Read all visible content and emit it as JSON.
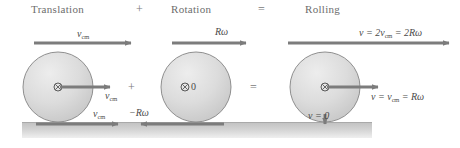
{
  "figure": {
    "title_row": {
      "translation": "Translation",
      "plus_top": "+",
      "rotation": "Rotation",
      "equals_top": "=",
      "rolling": "Rolling"
    },
    "operators": {
      "plus_mid": "+",
      "equals_mid": "="
    },
    "panels": [
      {
        "name": "translation",
        "heading": "Translation",
        "circle": {
          "cx": 58,
          "cy": 87,
          "r": 35
        },
        "center_marker": "⊗",
        "center_marker_value": "",
        "labels": {
          "top": "v_cm",
          "top_html": "v<sub>cm</sub>",
          "middle": "v_cm",
          "middle_html": "v<sub>cm</sub>",
          "bottom": "v_cm",
          "bottom_html": "v<sub>cm</sub>"
        }
      },
      {
        "name": "rotation",
        "heading": "Rotation",
        "circle": {
          "cx": 196,
          "cy": 87,
          "r": 35
        },
        "center_marker": "⊗",
        "center_marker_value": "0",
        "labels": {
          "top": "Rω",
          "top_html": "Rω",
          "bottom": "−Rω",
          "bottom_html": "−Rω"
        }
      },
      {
        "name": "rolling",
        "heading": "Rolling",
        "circle": {
          "cx": 325,
          "cy": 87,
          "r": 35
        },
        "center_marker": "⊗",
        "center_marker_value": "",
        "labels": {
          "top": "v = 2v_cm = 2Rω",
          "top_html": "v = 2v<sub>cm</sub> = 2Rω",
          "middle": "v = v_cm = Rω",
          "middle_html": "v = v<sub>cm</sub> = Rω",
          "bottom": "v = 0",
          "bottom_html": "v = 0"
        }
      }
    ],
    "colors": {
      "arrow": "#7c7c7c",
      "circle_fill_light": "#e4e4e4",
      "circle_fill_dark": "#c9c9c9",
      "circle_stroke": "#8c8c8c",
      "ground": "#c4c4c4",
      "heading_text": "#6d6d6d",
      "label_text": "#4a4a4a"
    }
  }
}
